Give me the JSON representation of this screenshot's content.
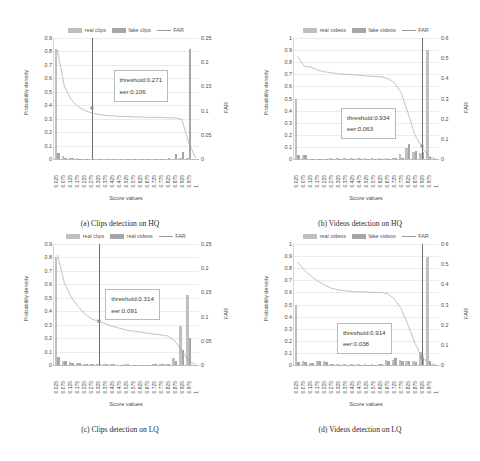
{
  "page_header": "",
  "figure_caption": "",
  "axis": {
    "xlabel": "Score values",
    "ylabel_left": "Probability density",
    "ylabel_right": "FAR",
    "xticks": [
      "0.025",
      "0.075",
      "0.125",
      "0.175",
      "0.225",
      "0.275",
      "0.325",
      "0.375",
      "0.425",
      "0.475",
      "0.525",
      "0.575",
      "0.625",
      "0.675",
      "0.725",
      "0.775",
      "0.825",
      "0.875",
      "0.925",
      "0.975",
      "1"
    ]
  },
  "colors": {
    "real_bar": "#bfbfbf",
    "fake_bar": "#a6a6a6",
    "far_line": "#9a9a9a",
    "threshold_line": "#6f6f6f",
    "gridline": "#ececec"
  },
  "chart_data": [
    {
      "id": "a",
      "type": "bar",
      "title": "(a) Clips detection on HQ",
      "xlabel": "Score values",
      "ylabel": "Probability density",
      "ylabel_right": "FAR",
      "ylim": [
        0,
        0.9
      ],
      "ylim_right": [
        0,
        0.25
      ],
      "yticks": [
        "0",
        "0.1",
        "0.2",
        "0.3",
        "0.4",
        "0.5",
        "0.6",
        "0.7",
        "0.8",
        "0.9"
      ],
      "yticks_right": [
        "0",
        "0.05",
        "0.1",
        "0.15",
        "0.2",
        "0.25"
      ],
      "grid": true,
      "legend": [
        "real clips",
        "fake clips",
        "FAR"
      ],
      "legend_position": "top-center",
      "categories": [
        "0.025",
        "0.075",
        "0.125",
        "0.175",
        "0.225",
        "0.275",
        "0.325",
        "0.375",
        "0.425",
        "0.475",
        "0.525",
        "0.575",
        "0.625",
        "0.675",
        "0.725",
        "0.775",
        "0.825",
        "0.875",
        "0.925",
        "0.975",
        "1"
      ],
      "series": [
        {
          "name": "real clips",
          "values": [
            0.815,
            0.02,
            0.006,
            0.004,
            0.003,
            0.003,
            0.002,
            0.002,
            0.002,
            0.002,
            0.002,
            0.002,
            0.002,
            0.002,
            0.002,
            0.002,
            0.002,
            0.003,
            0.005,
            0.01,
            0.0
          ]
        },
        {
          "name": "fake clips",
          "values": [
            0.047,
            0.01,
            0.004,
            0.003,
            0.002,
            0.002,
            0.002,
            0.002,
            0.002,
            0.002,
            0.002,
            0.002,
            0.002,
            0.002,
            0.002,
            0.003,
            0.006,
            0.034,
            0.052,
            0.815,
            0.0
          ]
        },
        {
          "name": "FAR",
          "axis": "right",
          "values": [
            0.225,
            0.15,
            0.122,
            0.108,
            0.1,
            0.095,
            0.092,
            0.09,
            0.089,
            0.088,
            0.088,
            0.087,
            0.087,
            0.086,
            0.086,
            0.086,
            0.085,
            0.085,
            0.082,
            0.035,
            0.002
          ]
        }
      ],
      "annotation": {
        "threshold": "threshold:0.271",
        "eer": "eer:0.106"
      },
      "threshold_value": 0.271,
      "eer_value": 0.106
    },
    {
      "id": "b",
      "type": "bar",
      "title": "(b) Videos detection on HQ",
      "xlabel": "Score values",
      "ylabel": "Probability density",
      "ylabel_right": "FAR",
      "ylim": [
        0,
        1
      ],
      "ylim_right": [
        0,
        0.6
      ],
      "yticks": [
        "0",
        "0.1",
        "0.2",
        "0.3",
        "0.4",
        "0.5",
        "0.6",
        "0.7",
        "0.8",
        "0.9",
        "1"
      ],
      "yticks_right": [
        "0",
        "0.1",
        "0.2",
        "0.3",
        "0.4",
        "0.5",
        "0.6"
      ],
      "grid": true,
      "legend": [
        "real videos",
        "fake videos",
        "FAR"
      ],
      "legend_position": "top-center",
      "categories": [
        "0.025",
        "0.075",
        "0.125",
        "0.175",
        "0.225",
        "0.275",
        "0.325",
        "0.375",
        "0.425",
        "0.475",
        "0.525",
        "0.575",
        "0.625",
        "0.675",
        "0.725",
        "0.775",
        "0.825",
        "0.875",
        "0.925",
        "0.975",
        "1"
      ],
      "series": [
        {
          "name": "real videos",
          "values": [
            0.5,
            0.03,
            0.003,
            0.003,
            0.003,
            0.006,
            0.008,
            0.008,
            0.008,
            0.008,
            0.008,
            0.008,
            0.008,
            0.008,
            0.012,
            0.04,
            0.095,
            0.06,
            0.05,
            0.9,
            0.0
          ]
        },
        {
          "name": "fake videos",
          "values": [
            0.03,
            0.03,
            0.002,
            0.002,
            0.002,
            0.004,
            0.004,
            0.004,
            0.004,
            0.004,
            0.004,
            0.004,
            0.004,
            0.004,
            0.006,
            0.012,
            0.12,
            0.07,
            0.06,
            0.02,
            0.0
          ]
        },
        {
          "name": "FAR",
          "axis": "right",
          "values": [
            0.51,
            0.46,
            0.455,
            0.44,
            0.432,
            0.428,
            0.422,
            0.42,
            0.418,
            0.415,
            0.412,
            0.41,
            0.408,
            0.4,
            0.38,
            0.33,
            0.23,
            0.12,
            0.06,
            0.012,
            0.002
          ]
        }
      ],
      "annotation": {
        "threshold": "threshold:0.934",
        "eer": "eer:0.063"
      },
      "threshold_value": 0.934,
      "eer_value": 0.063
    },
    {
      "id": "c",
      "type": "bar",
      "title": "(c) Clips detection on LQ",
      "xlabel": "Score values",
      "ylabel": "Probability density",
      "ylabel_right": "FAR",
      "ylim": [
        0,
        0.9
      ],
      "ylim_right": [
        0,
        0.25
      ],
      "yticks": [
        "0",
        "0.1",
        "0.2",
        "0.3",
        "0.4",
        "0.5",
        "0.6",
        "0.7",
        "0.8",
        "0.9"
      ],
      "yticks_right": [
        "0",
        "0.05",
        "0.1",
        "0.15",
        "0.2",
        "0.25"
      ],
      "grid": true,
      "legend": [
        "real clips",
        "real videos",
        "FAR"
      ],
      "legend_position": "top-center",
      "categories": [
        "0.025",
        "0.075",
        "0.125",
        "0.175",
        "0.225",
        "0.275",
        "0.325",
        "0.375",
        "0.425",
        "0.475",
        "0.525",
        "0.575",
        "0.625",
        "0.675",
        "0.725",
        "0.775",
        "0.825",
        "0.875",
        "0.925",
        "0.975",
        "1"
      ],
      "series": [
        {
          "name": "real clips",
          "values": [
            0.8,
            0.03,
            0.02,
            0.014,
            0.01,
            0.008,
            0.006,
            0.005,
            0.004,
            0.003,
            0.004,
            0.003,
            0.003,
            0.003,
            0.004,
            0.006,
            0.01,
            0.05,
            0.29,
            0.52,
            0.0
          ]
        },
        {
          "name": "real videos",
          "values": [
            0.06,
            0.028,
            0.016,
            0.012,
            0.009,
            0.007,
            0.005,
            0.004,
            0.004,
            0.003,
            0.004,
            0.003,
            0.003,
            0.003,
            0.004,
            0.006,
            0.009,
            0.03,
            0.11,
            0.2,
            0.0
          ]
        },
        {
          "name": "FAR",
          "axis": "right",
          "values": [
            0.228,
            0.17,
            0.14,
            0.12,
            0.105,
            0.095,
            0.09,
            0.085,
            0.08,
            0.076,
            0.072,
            0.07,
            0.068,
            0.066,
            0.064,
            0.062,
            0.06,
            0.05,
            0.03,
            0.008,
            0.001
          ]
        }
      ],
      "annotation": {
        "threshold": "threshold:0.314",
        "eer": "eer:0.091"
      },
      "threshold_value": 0.314,
      "eer_value": 0.091
    },
    {
      "id": "d",
      "type": "bar",
      "title": "(d) Videos detection on LQ",
      "xlabel": "Score values",
      "ylabel": "Probability density",
      "ylabel_right": "FAR",
      "ylim": [
        0,
        1
      ],
      "ylim_right": [
        0,
        0.6
      ],
      "yticks": [
        "0",
        "0.1",
        "0.2",
        "0.3",
        "0.4",
        "0.5",
        "0.6",
        "0.7",
        "0.8",
        "0.9",
        "1"
      ],
      "yticks_right": [
        "0",
        "0.1",
        "0.2",
        "0.3",
        "0.4",
        "0.5",
        "0.6"
      ],
      "grid": true,
      "legend": [
        "real videos",
        "fake videos",
        "FAR"
      ],
      "legend_position": "top-center",
      "categories": [
        "0.025",
        "0.075",
        "0.125",
        "0.175",
        "0.225",
        "0.275",
        "0.325",
        "0.375",
        "0.425",
        "0.475",
        "0.525",
        "0.575",
        "0.625",
        "0.675",
        "0.725",
        "0.775",
        "0.825",
        "0.875",
        "0.925",
        "0.975",
        "1"
      ],
      "series": [
        {
          "name": "real videos",
          "values": [
            0.5,
            0.03,
            0.016,
            0.035,
            0.03,
            0.006,
            0.005,
            0.005,
            0.005,
            0.005,
            0.005,
            0.005,
            0.006,
            0.038,
            0.04,
            0.042,
            0.035,
            0.03,
            0.105,
            0.89,
            0.0
          ]
        },
        {
          "name": "fake videos",
          "values": [
            0.028,
            0.026,
            0.014,
            0.03,
            0.026,
            0.005,
            0.004,
            0.004,
            0.004,
            0.004,
            0.004,
            0.004,
            0.005,
            0.03,
            0.055,
            0.036,
            0.03,
            0.026,
            0.06,
            0.03,
            0.0
          ]
        },
        {
          "name": "FAR",
          "axis": "right",
          "values": [
            0.512,
            0.47,
            0.44,
            0.415,
            0.395,
            0.38,
            0.372,
            0.368,
            0.365,
            0.363,
            0.362,
            0.36,
            0.36,
            0.355,
            0.33,
            0.28,
            0.2,
            0.11,
            0.04,
            0.008,
            0.001
          ]
        }
      ],
      "annotation": {
        "threshold": "threshold:0.914",
        "eer": "eer:0.038"
      },
      "threshold_value": 0.914,
      "eer_value": 0.038
    }
  ]
}
